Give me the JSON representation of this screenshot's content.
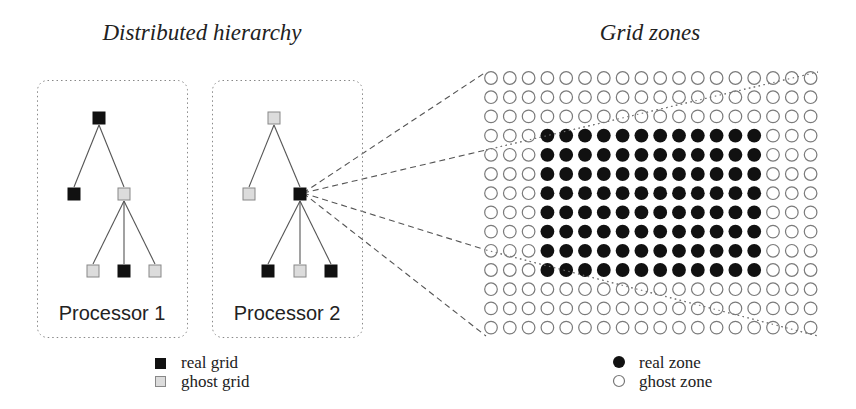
{
  "titles": {
    "left": "Distributed hierarchy",
    "right": "Grid zones"
  },
  "processors": [
    {
      "label": "Processor 1",
      "box": {
        "x": 37,
        "y": 80,
        "w": 150,
        "h": 257
      },
      "nodes": [
        {
          "id": "root",
          "x": 99,
          "y": 118,
          "type": "real"
        },
        {
          "id": "l1a",
          "x": 74,
          "y": 194,
          "type": "real"
        },
        {
          "id": "l1b",
          "x": 124,
          "y": 194,
          "type": "ghost"
        },
        {
          "id": "l2a",
          "x": 93,
          "y": 271,
          "type": "ghost"
        },
        {
          "id": "l2b",
          "x": 124,
          "y": 271,
          "type": "real"
        },
        {
          "id": "l2c",
          "x": 155,
          "y": 271,
          "type": "ghost"
        }
      ],
      "edges": [
        [
          "root",
          "l1a"
        ],
        [
          "root",
          "l1b"
        ],
        [
          "l1b",
          "l2a"
        ],
        [
          "l1b",
          "l2b"
        ],
        [
          "l1b",
          "l2c"
        ]
      ]
    },
    {
      "label": "Processor 2",
      "box": {
        "x": 212,
        "y": 80,
        "w": 150,
        "h": 257
      },
      "nodes": [
        {
          "id": "root",
          "x": 274,
          "y": 118,
          "type": "ghost"
        },
        {
          "id": "l1a",
          "x": 249,
          "y": 194,
          "type": "ghost"
        },
        {
          "id": "l1b",
          "x": 300,
          "y": 194,
          "type": "real"
        },
        {
          "id": "l2a",
          "x": 268,
          "y": 271,
          "type": "real"
        },
        {
          "id": "l2b",
          "x": 300,
          "y": 271,
          "type": "ghost"
        },
        {
          "id": "l2c",
          "x": 331,
          "y": 271,
          "type": "real"
        }
      ],
      "edges": [
        [
          "root",
          "l1a"
        ],
        [
          "root",
          "l1b"
        ],
        [
          "l1b",
          "l2a"
        ],
        [
          "l1b",
          "l2b"
        ],
        [
          "l1b",
          "l2c"
        ]
      ]
    }
  ],
  "zone_grid": {
    "cols": 18,
    "rows": 14,
    "origin_x": 491,
    "origin_y": 78,
    "dx": 18.8,
    "dy": 19.2,
    "radius": 6.3,
    "real_cols": [
      3,
      14
    ],
    "real_rows": [
      3,
      10
    ]
  },
  "connectors": {
    "from": {
      "x": 303,
      "y": 193
    },
    "dashed_to": [
      {
        "x": 486,
        "y": 72
      },
      {
        "x": 486,
        "y": 150
      },
      {
        "x": 486,
        "y": 250
      },
      {
        "x": 486,
        "y": 336
      }
    ],
    "dotted": [
      {
        "x1": 486,
        "y1": 150,
        "x2": 818,
        "y2": 72
      },
      {
        "x1": 486,
        "y1": 250,
        "x2": 818,
        "y2": 336
      }
    ]
  },
  "legend_left": {
    "items": [
      {
        "label": "real grid",
        "type": "real"
      },
      {
        "label": "ghost grid",
        "type": "ghost"
      }
    ]
  },
  "legend_right": {
    "items": [
      {
        "label": "real zone",
        "type": "real"
      },
      {
        "label": "ghost zone",
        "type": "ghost"
      }
    ]
  },
  "colors": {
    "real": "#111111",
    "ghost_fill": "#dcdcdc",
    "ghost_stroke": "#888888",
    "zone_ring": "#7a7a7a"
  }
}
